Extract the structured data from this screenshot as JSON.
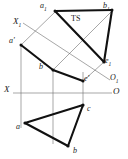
{
  "figure": {
    "kind": "descriptive-geometry-projection",
    "title": "",
    "background_color": "#ffffff",
    "stroke_color": "#1a1a1a",
    "thin_stroke_color": "#555555",
    "labels": [
      {
        "id": "a1",
        "text": "a",
        "sub": "1",
        "x": 40,
        "y": 2,
        "style": "italic"
      },
      {
        "id": "b1",
        "text": "b",
        "sub": "1",
        "x": 103,
        "y": 2,
        "style": "italic"
      },
      {
        "id": "ts",
        "text": "TS",
        "sub": "",
        "x": 71,
        "y": 15,
        "style": "upright"
      },
      {
        "id": "x1",
        "text": "X",
        "sub": "1",
        "x": 13,
        "y": 17,
        "style": "italic-big"
      },
      {
        "id": "aprime",
        "text": "a'",
        "sub": "",
        "x": 9,
        "y": 37,
        "style": "italic"
      },
      {
        "id": "e1",
        "text": "e",
        "sub": "1",
        "x": 105,
        "y": 57,
        "style": "italic"
      },
      {
        "id": "bprime",
        "text": "b'",
        "sub": "",
        "x": 39,
        "y": 63,
        "style": "italic"
      },
      {
        "id": "eprime",
        "text": "e'",
        "sub": "",
        "x": 84,
        "y": 75,
        "style": "italic"
      },
      {
        "id": "o1",
        "text": "O",
        "sub": "1",
        "x": 110,
        "y": 74,
        "style": "italic"
      },
      {
        "id": "x",
        "text": "X",
        "sub": "",
        "x": 4,
        "y": 85,
        "style": "italic-big"
      },
      {
        "id": "o",
        "text": "O",
        "sub": "",
        "x": 113,
        "y": 89,
        "style": "italic-big"
      },
      {
        "id": "c",
        "text": "c",
        "sub": "",
        "x": 87,
        "y": 106,
        "style": "italic"
      },
      {
        "id": "a",
        "text": "a",
        "sub": "",
        "x": 17,
        "y": 124,
        "style": "italic"
      },
      {
        "id": "b",
        "text": "b",
        "sub": "",
        "x": 74,
        "y": 147,
        "style": "italic"
      }
    ],
    "points": {
      "a1": {
        "x": 54,
        "y": 11
      },
      "b1": {
        "x": 112,
        "y": 10
      },
      "c1": {
        "x": 104,
        "y": 62
      },
      "e1": {
        "x": 104,
        "y": 62
      },
      "a_front": {
        "x": 21,
        "y": 45
      },
      "b_front": {
        "x": 53,
        "y": 70
      },
      "e_front": {
        "x": 83,
        "y": 81
      },
      "c_front": {
        "x": 83,
        "y": 72
      },
      "a_top": {
        "x": 25,
        "y": 123
      },
      "b_top": {
        "x": 68,
        "y": 146
      },
      "c_top": {
        "x": 83,
        "y": 105
      },
      "x_axis_left": {
        "x": 14,
        "y": 93
      },
      "x_axis_right": {
        "x": 112,
        "y": 93
      },
      "x1_axis_start": {
        "x": 24,
        "y": 24
      },
      "x1_axis_end": {
        "x": 110,
        "y": 80
      }
    },
    "axes": [
      {
        "name": "ground-line-X-O",
        "from_label": "X",
        "to_label": "O"
      },
      {
        "name": "auxiliary-line-X1-O1",
        "from_label": "X1",
        "to_label": "O1"
      }
    ]
  }
}
